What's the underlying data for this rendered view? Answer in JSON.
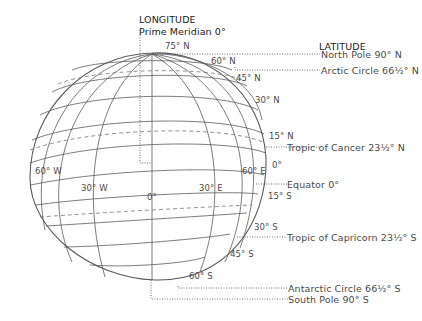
{
  "diagram": {
    "title_longitude": "LONGITUDE",
    "prime_meridian": "Prime Meridian 0°",
    "title_latitude": "LATITUDE",
    "latitude_callouts": [
      {
        "label": "North Pole 90° N"
      },
      {
        "label": "Arctic Circle 66½° N"
      },
      {
        "label": "Tropic of Cancer 23½° N"
      },
      {
        "label": "Equator 0°"
      },
      {
        "label": "Tropic of Capricorn 23½° S"
      },
      {
        "label": "Antarctic Circle 66½° S"
      },
      {
        "label": "South Pole 90° S"
      }
    ],
    "latitude_ticks": {
      "n75": "75° N",
      "n60": "60° N",
      "n45": "45° N",
      "n30": "30° N",
      "n15": "15° N",
      "eq": "0°",
      "s15": "15° S",
      "s30": "30° S",
      "s45": "45° S",
      "s60": "60° S"
    },
    "longitude_ticks": {
      "w60": "60° W",
      "w30": "30° W",
      "zero": "0°",
      "e30": "30° E",
      "e60": "60° E"
    },
    "colors": {
      "grid_line": "#555555",
      "leader_line": "#444444",
      "text": "#4a4a4a"
    }
  }
}
